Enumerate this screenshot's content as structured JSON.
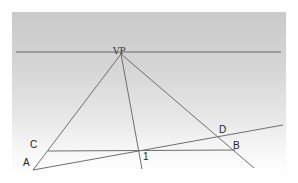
{
  "diagram": {
    "type": "one-point-perspective-construction",
    "colors": {
      "line": "#6e6e6e",
      "horizon": "#666666",
      "background_top": "#c9c9c9",
      "background_bottom": "#ffffff"
    },
    "horizon": {
      "x1": 16,
      "y1": 52,
      "x2": 281,
      "y2": 52
    },
    "vanishing_point": {
      "label": "VP",
      "x": 121,
      "y": 54
    },
    "points": [
      {
        "label": "A",
        "x": 33,
        "y": 170
      },
      {
        "label": "B",
        "x": 235,
        "y": 150
      },
      {
        "label": "C",
        "x": 48,
        "y": 151
      },
      {
        "label": "D",
        "x": 218,
        "y": 136
      },
      {
        "label": "1",
        "x": 139,
        "y": 151
      }
    ],
    "lines": [
      {
        "name": "vp-to-a-line",
        "x1": 121,
        "y1": 54,
        "x2": 33,
        "y2": 170
      },
      {
        "name": "vp-to-1-line",
        "x1": 121,
        "y1": 54,
        "x2": 142,
        "y2": 169
      },
      {
        "name": "vp-to-b-line",
        "x1": 121,
        "y1": 54,
        "x2": 254,
        "y2": 168
      },
      {
        "name": "c-to-b-line",
        "x1": 48,
        "y1": 151,
        "x2": 235,
        "y2": 150
      },
      {
        "name": "a-to-d-line",
        "x1": 33,
        "y1": 170,
        "x2": 283,
        "y2": 125
      }
    ],
    "labels": [
      {
        "name": "vp-label",
        "text": "VP",
        "x": 113,
        "y": 54
      },
      {
        "name": "point-c-label",
        "text": "C",
        "x": 30,
        "y": 148
      },
      {
        "name": "point-a-label",
        "text": "A",
        "x": 23,
        "y": 166
      },
      {
        "name": "point-1-label",
        "text": "1",
        "x": 143,
        "y": 160
      },
      {
        "name": "point-d-label",
        "text": "D",
        "x": 219,
        "y": 133
      },
      {
        "name": "point-b-label",
        "text": "B",
        "x": 233,
        "y": 149
      }
    ]
  }
}
